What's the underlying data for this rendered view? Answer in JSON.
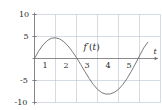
{
  "figure": {
    "name": "derivative-graph",
    "background_color": "#ffffff",
    "grid_color": "#b9c3cf",
    "axis_color": "#6f6f6f",
    "curve_color": "#6b6b6b",
    "text_color": "#2b2b2b"
  },
  "labels": {
    "curve_label_f": "f",
    "curve_label_prime": "′",
    "curve_label_arg": "(t)",
    "curve_label_full": "f′(t)",
    "x_axis_name": "t"
  },
  "chart_data": {
    "type": "line",
    "title": "",
    "xlabel": "t",
    "ylabel": "",
    "grid": true,
    "legend": "none",
    "xlim": [
      0,
      6
    ],
    "ylim": [
      -10,
      10
    ],
    "xticks": [
      1,
      2,
      3,
      4,
      5
    ],
    "xtick_labels": [
      "1",
      "2",
      "3",
      "4",
      "5"
    ],
    "yticks": [
      -10,
      -5,
      5,
      10
    ],
    "ytick_labels": [
      "-10",
      "-5",
      "5",
      "10"
    ],
    "xgridlines": [
      0,
      1,
      2,
      3,
      4,
      5,
      6
    ],
    "ygridlines": [
      -10,
      -5,
      0,
      5,
      10
    ],
    "annotations": [
      {
        "text": "f′(t)",
        "x": 2.7,
        "y": 2.4
      }
    ],
    "series": [
      {
        "name": "f'(t)",
        "x": [
          0.0,
          0.2,
          0.4,
          0.6,
          0.8,
          1.0,
          1.2,
          1.4,
          1.6,
          1.8,
          2.0,
          2.2,
          2.4,
          2.6,
          2.8,
          3.0,
          3.2,
          3.4,
          3.6,
          3.8,
          4.0,
          4.2,
          4.4,
          4.6,
          4.8,
          5.0,
          5.2,
          5.4
        ],
        "y": [
          0.0,
          1.7,
          3.05,
          4.05,
          4.6,
          4.7,
          4.45,
          3.8,
          2.85,
          1.6,
          0.2,
          -1.35,
          -2.95,
          -4.5,
          -5.9,
          -7.0,
          -7.75,
          -8.1,
          -8.05,
          -7.7,
          -7.0,
          -5.95,
          -4.6,
          -3.0,
          -1.25,
          0.6,
          2.4,
          3.7
        ]
      }
    ]
  }
}
